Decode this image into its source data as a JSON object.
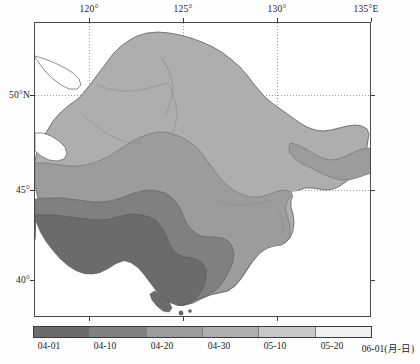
{
  "figure": {
    "type": "contour-map",
    "region": "Northeast China"
  },
  "axes": {
    "lon_ticks": [
      {
        "label": "120°",
        "value": 120,
        "x": 89
      },
      {
        "label": "125°",
        "value": 125,
        "x": 183
      },
      {
        "label": "130°",
        "value": 130,
        "x": 277
      },
      {
        "label": "135°E",
        "value": 135,
        "x": 371
      }
    ],
    "lat_ticks": [
      {
        "label": "50°N",
        "value": 50,
        "y": 95
      },
      {
        "label": "45°",
        "value": 45,
        "y": 190
      },
      {
        "label": "40°",
        "value": 40,
        "y": 280
      }
    ],
    "frame": {
      "left": 34,
      "top": 22,
      "width": 337,
      "height": 295
    },
    "grid": "dotted"
  },
  "colorbar": {
    "orientation": "horizontal",
    "unit_label": "06-01(月-日)",
    "segments": [
      {
        "range": "04-01 – 04-10",
        "color": "#6b6b6b"
      },
      {
        "range": "04-10 – 04-20",
        "color": "#808080"
      },
      {
        "range": "04-20 – 04-30",
        "color": "#9c9c9c"
      },
      {
        "range": "04-30 – 05-10",
        "color": "#aeaeae"
      },
      {
        "range": "05-10 – 05-20",
        "color": "#c8c8c8"
      },
      {
        "range": "05-20 – 06-01",
        "color": "#efefef"
      }
    ],
    "tick_labels": [
      {
        "label": "04-01",
        "x": 33
      },
      {
        "label": "04-10",
        "x": 89
      },
      {
        "label": "04-20",
        "x": 146
      },
      {
        "label": "04-30",
        "x": 203
      },
      {
        "label": "05-10",
        "x": 259
      },
      {
        "label": "05-20",
        "x": 316
      },
      {
        "label": "06-01(月-日)",
        "x": 372
      }
    ]
  },
  "map_fills": {
    "band_darkest": "#6b6b6b",
    "band_dark": "#808080",
    "band_mid": "#9c9c9c",
    "band_light": "#aeaeae",
    "outline": "#5a5a5a",
    "province_line": "#7a7a7a",
    "background": "#ffffff"
  }
}
